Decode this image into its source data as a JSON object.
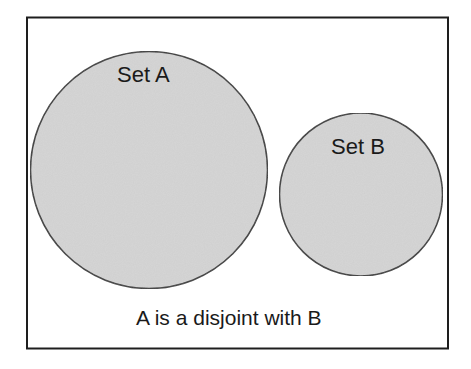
{
  "diagram": {
    "type": "venn",
    "sets": [
      {
        "label": "Set A",
        "fill": "#d4d4d4",
        "stroke": "#3a3a3a"
      },
      {
        "label": "Set B",
        "fill": "#d4d4d4",
        "stroke": "#3a3a3a"
      }
    ],
    "caption": "A is a disjoint with B",
    "frame_color": "#1e1e1e",
    "background": "#ffffff"
  }
}
